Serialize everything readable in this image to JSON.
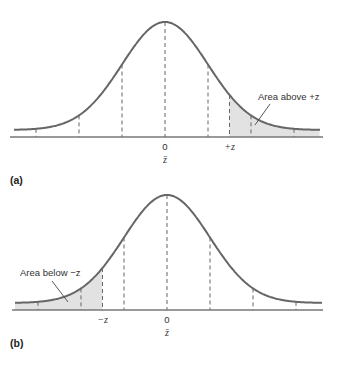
{
  "colors": {
    "curve": "#666666",
    "axis": "#777777",
    "dash": "#666666",
    "shade": "#e2e2e2",
    "text": "#333333"
  },
  "panels": [
    {
      "id": "a",
      "panel_label": "(a)",
      "center_label": "0",
      "mean_label": "z̄",
      "z_label": "+z",
      "z_value_sd": 1.5,
      "shaded_tail": "upper",
      "annotation": "Area above +z",
      "dashed_sd_marks": [
        -3,
        -2,
        -1,
        0,
        1,
        2,
        3
      ]
    },
    {
      "id": "b",
      "panel_label": "(b)",
      "center_label": "0",
      "mean_label": "z̄",
      "z_label": "−z",
      "z_value_sd": -1.5,
      "shaded_tail": "lower",
      "annotation": "Area below −z",
      "dashed_sd_marks": [
        -3,
        -2,
        -1,
        0,
        1,
        2,
        3
      ]
    }
  ]
}
